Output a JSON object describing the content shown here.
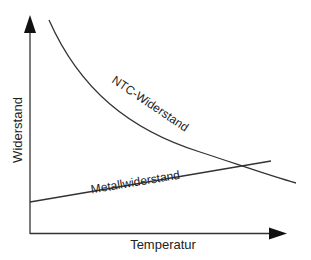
{
  "diagram": {
    "xlabel": "Temperatur",
    "ylabel": "Widerstand",
    "curves": [
      {
        "name": "NTC-Widerstand",
        "shape": "decreasing-curve"
      },
      {
        "name": "Metallwiderstand",
        "shape": "increasing-line"
      }
    ],
    "line_color": "#333333"
  }
}
